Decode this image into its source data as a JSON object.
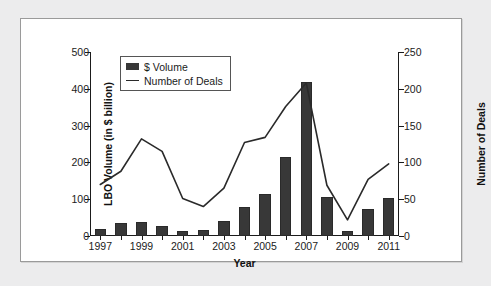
{
  "chart_data": {
    "type": "bar",
    "title": "",
    "xlabel": "Year",
    "ylabel": "LBO Volume (in $ billion)",
    "y2label": "Number of Deals",
    "ylim": [
      0,
      500
    ],
    "y2lim": [
      0,
      250
    ],
    "grid": false,
    "legend_position": "top-left",
    "categories": [
      1997,
      1998,
      1999,
      2000,
      2001,
      2002,
      2003,
      2004,
      2005,
      2006,
      2007,
      2008,
      2009,
      2010,
      2011
    ],
    "x_tick_labels": [
      "1997",
      "",
      "1999",
      "",
      "2001",
      "",
      "2003",
      "",
      "2005",
      "",
      "2007",
      "",
      "2009",
      "",
      "2011"
    ],
    "y_tick_labels": [
      "0",
      "100",
      "200",
      "300",
      "400",
      "500"
    ],
    "y_tick_values": [
      0,
      100,
      200,
      300,
      400,
      500
    ],
    "y2_tick_labels": [
      "0",
      "50",
      "100",
      "150",
      "200",
      "250"
    ],
    "y2_tick_values": [
      0,
      50,
      100,
      150,
      200,
      250
    ],
    "series": [
      {
        "name": "$ Volume",
        "type": "bar",
        "axis": "left",
        "unit": "$ billion",
        "color": "#383838",
        "values": [
          18,
          36,
          37,
          28,
          14,
          16,
          41,
          80,
          115,
          216,
          418,
          106,
          13,
          74,
          103
        ]
      },
      {
        "name": "Number of Deals",
        "type": "line",
        "axis": "right",
        "unit": "deals",
        "color": "#2a2a2a",
        "values": [
          70,
          88,
          132,
          115,
          51,
          40,
          65,
          127,
          134,
          176,
          208,
          69,
          22,
          77,
          98
        ]
      }
    ]
  },
  "legend": {
    "items": [
      {
        "label": "$ Volume",
        "marker": "bar-swatch"
      },
      {
        "label": "Number of Deals",
        "marker": "line-swatch"
      }
    ]
  },
  "colors": {
    "bar": "#383838",
    "line": "#2a2a2a",
    "axis": "#1b1b1b",
    "panel_background": "#ffffff",
    "page_background": "#ececed",
    "panel_border": "#9a9a9a"
  }
}
